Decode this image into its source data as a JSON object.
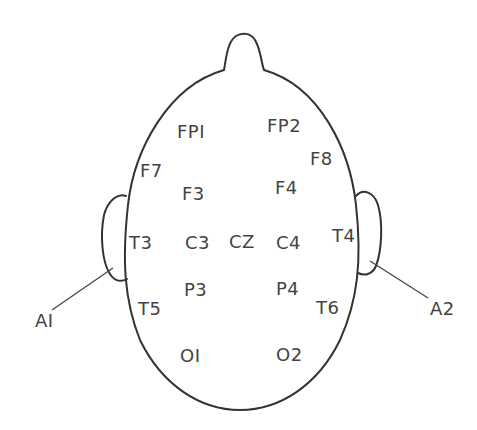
{
  "diagram": {
    "type": "EEG 10-20 electrode placement (top view of head)",
    "colors": {
      "outline": "#333333",
      "text": "#444444",
      "background": "#ffffff"
    },
    "electrodes": [
      {
        "id": "fp1",
        "label": "FPI",
        "x": 177,
        "y": 138
      },
      {
        "id": "fp2",
        "label": "FP2",
        "x": 267,
        "y": 132
      },
      {
        "id": "f7",
        "label": "F7",
        "x": 140,
        "y": 177
      },
      {
        "id": "f8",
        "label": "F8",
        "x": 310,
        "y": 165
      },
      {
        "id": "f3",
        "label": "F3",
        "x": 182,
        "y": 200
      },
      {
        "id": "f4",
        "label": "F4",
        "x": 275,
        "y": 194
      },
      {
        "id": "t3",
        "label": "T3",
        "x": 129,
        "y": 249
      },
      {
        "id": "c3",
        "label": "C3",
        "x": 185,
        "y": 249
      },
      {
        "id": "cz",
        "label": "CZ",
        "x": 229,
        "y": 248
      },
      {
        "id": "c4",
        "label": "C4",
        "x": 276,
        "y": 249
      },
      {
        "id": "t4",
        "label": "T4",
        "x": 332,
        "y": 242
      },
      {
        "id": "p3",
        "label": "P3",
        "x": 184,
        "y": 296
      },
      {
        "id": "p4",
        "label": "P4",
        "x": 276,
        "y": 295
      },
      {
        "id": "t5",
        "label": "T5",
        "x": 138,
        "y": 315
      },
      {
        "id": "t6",
        "label": "T6",
        "x": 316,
        "y": 314
      },
      {
        "id": "o1",
        "label": "OI",
        "x": 180,
        "y": 362
      },
      {
        "id": "o2",
        "label": "O2",
        "x": 276,
        "y": 361
      }
    ],
    "ear_references": [
      {
        "id": "a1",
        "label": "AI",
        "x": 35,
        "y": 327
      },
      {
        "id": "a2",
        "label": "A2",
        "x": 430,
        "y": 315
      }
    ]
  }
}
